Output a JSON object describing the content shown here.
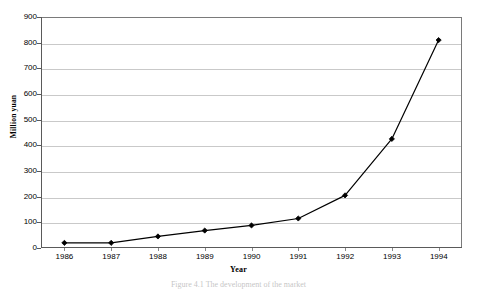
{
  "chart_data": {
    "type": "line",
    "title": "",
    "xlabel": "Year",
    "ylabel": "Million yuan",
    "categories": [
      "1986",
      "1987",
      "1988",
      "1989",
      "1990",
      "1991",
      "1992",
      "1993",
      "1994"
    ],
    "values": [
      20,
      20,
      45,
      68,
      88,
      115,
      205,
      425,
      810
    ],
    "ylim": [
      0,
      900
    ],
    "yticks": [
      0,
      100,
      200,
      300,
      400,
      500,
      600,
      700,
      800,
      900
    ],
    "ytick_labels": [
      "0",
      "100",
      "200",
      "300",
      "400",
      "500",
      "600",
      "700",
      "800",
      "900"
    ],
    "grid": "horizontal",
    "legend": "none",
    "series_color": "#000000",
    "marker": "filled-diamond",
    "gridline_color": "#c9c9c9",
    "frame_color": "#7a7a7a"
  },
  "caption": {
    "text": "Figure 4.1 The development of the market"
  }
}
